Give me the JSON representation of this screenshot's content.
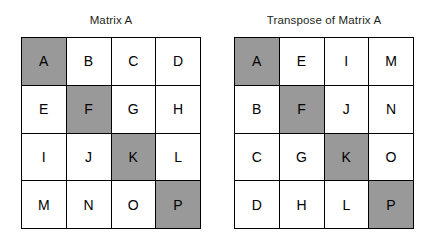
{
  "figure": {
    "background_color": "#ffffff",
    "border_color": "#000000",
    "text_color": "#231f20",
    "shaded_color": "#999999"
  },
  "panels": [
    {
      "id": "matrix-a",
      "title": "Matrix A",
      "rows": 4,
      "columns": 4,
      "cells": [
        {
          "label": "A",
          "shaded": true
        },
        {
          "label": "B",
          "shaded": false
        },
        {
          "label": "C",
          "shaded": false
        },
        {
          "label": "D",
          "shaded": false
        },
        {
          "label": "E",
          "shaded": false
        },
        {
          "label": "F",
          "shaded": true
        },
        {
          "label": "G",
          "shaded": false
        },
        {
          "label": "H",
          "shaded": false
        },
        {
          "label": "I",
          "shaded": false
        },
        {
          "label": "J",
          "shaded": false
        },
        {
          "label": "K",
          "shaded": true
        },
        {
          "label": "L",
          "shaded": false
        },
        {
          "label": "M",
          "shaded": false
        },
        {
          "label": "N",
          "shaded": false
        },
        {
          "label": "O",
          "shaded": false
        },
        {
          "label": "P",
          "shaded": true
        }
      ]
    },
    {
      "id": "matrix-a-transpose",
      "title": "Transpose of Matrix A",
      "rows": 4,
      "columns": 4,
      "cells": [
        {
          "label": "A",
          "shaded": true
        },
        {
          "label": "E",
          "shaded": false
        },
        {
          "label": "I",
          "shaded": false
        },
        {
          "label": "M",
          "shaded": false
        },
        {
          "label": "B",
          "shaded": false
        },
        {
          "label": "F",
          "shaded": true
        },
        {
          "label": "J",
          "shaded": false
        },
        {
          "label": "N",
          "shaded": false
        },
        {
          "label": "C",
          "shaded": false
        },
        {
          "label": "G",
          "shaded": false
        },
        {
          "label": "K",
          "shaded": true
        },
        {
          "label": "O",
          "shaded": false
        },
        {
          "label": "D",
          "shaded": false
        },
        {
          "label": "H",
          "shaded": false
        },
        {
          "label": "L",
          "shaded": false
        },
        {
          "label": "P",
          "shaded": true
        }
      ]
    }
  ]
}
